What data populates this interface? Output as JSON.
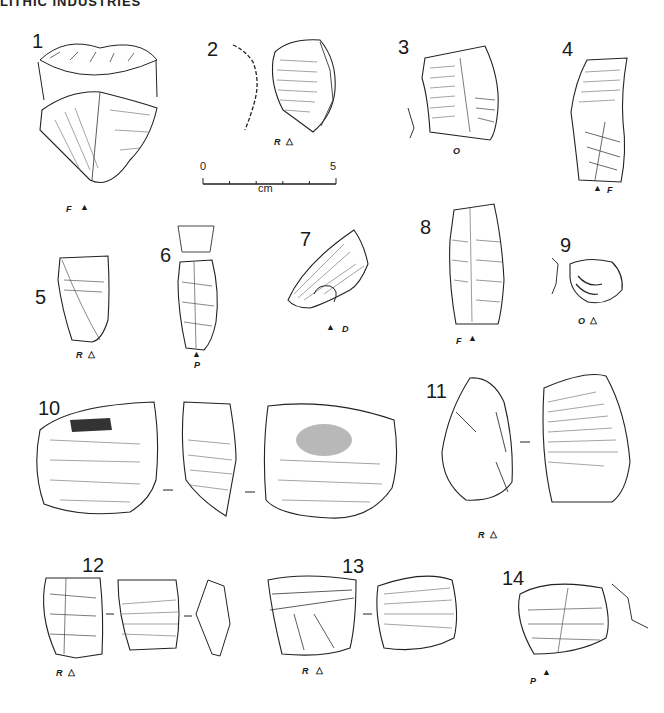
{
  "header": {
    "title": "LITHIC INDUSTRIES"
  },
  "scale_bar": {
    "start": "0",
    "end": "5",
    "unit": "cm",
    "ticks": 6
  },
  "figures": [
    {
      "number": "1",
      "codes": [
        "F",
        "▲"
      ]
    },
    {
      "number": "2",
      "codes": [
        "R",
        "△"
      ]
    },
    {
      "number": "3",
      "codes": [
        "O"
      ]
    },
    {
      "number": "4",
      "codes": [
        "▲",
        "F"
      ]
    },
    {
      "number": "5",
      "codes": [
        "R",
        "△"
      ]
    },
    {
      "number": "6",
      "codes": [
        "▲",
        "P"
      ]
    },
    {
      "number": "7",
      "codes": [
        "▲",
        "D"
      ]
    },
    {
      "number": "8",
      "codes": [
        "F",
        "▲"
      ]
    },
    {
      "number": "9",
      "codes": [
        "O",
        "△"
      ]
    },
    {
      "number": "10",
      "codes": []
    },
    {
      "number": "11",
      "codes": [
        "R",
        "△"
      ]
    },
    {
      "number": "12",
      "codes": [
        "R",
        "△"
      ]
    },
    {
      "number": "13",
      "codes": [
        "R",
        "△"
      ]
    },
    {
      "number": "14",
      "codes": [
        "P",
        "▲"
      ]
    }
  ],
  "legend_symbols": {
    "filled_triangle": "▲",
    "open_triangle": "△"
  }
}
